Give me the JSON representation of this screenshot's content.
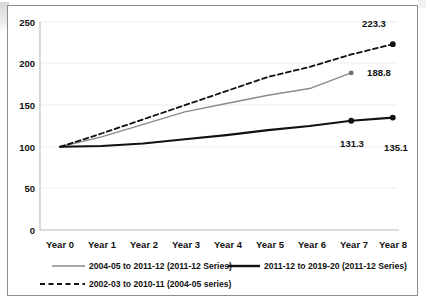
{
  "chart_data": {
    "type": "line",
    "title": "",
    "subtitle": "",
    "xlabel": "",
    "ylabel": "",
    "categories": [
      "Year 0",
      "Year 1",
      "Year 2",
      "Year 3",
      "Year 4",
      "Year 5",
      "Year 6",
      "Year 7",
      "Year 8"
    ],
    "ylim": [
      0,
      250
    ],
    "yticks": [
      0,
      50,
      100,
      150,
      200,
      250
    ],
    "ytick_labels": [
      "0",
      "50",
      "100",
      "150",
      "200",
      "250"
    ],
    "grid": true,
    "legend_position": "bottom",
    "series": [
      {
        "name": "2004-05 to 2011-12 (2011-12 Series)",
        "style": "solid",
        "color": "#8a8a8a",
        "width": 1.4,
        "values": [
          100,
          112,
          127,
          142,
          152,
          162,
          170,
          188.8,
          null
        ],
        "end_marker": true,
        "labels": [
          null,
          null,
          null,
          null,
          null,
          null,
          null,
          "188.8",
          null
        ]
      },
      {
        "name": "2011-12 to 2019-20 (2011-12 Series)",
        "style": "solid",
        "color": "#111111",
        "width": 2.1,
        "values": [
          100,
          101,
          104,
          109,
          114,
          120,
          125,
          131.3,
          135.1
        ],
        "end_marker": true,
        "labels": [
          null,
          null,
          null,
          null,
          null,
          null,
          null,
          "131.3",
          "135.1"
        ]
      },
      {
        "name": "2002-03 to 2010-11 (2004-05 series)",
        "style": "dashed",
        "color": "#111111",
        "width": 1.8,
        "values": [
          100,
          116,
          133,
          150,
          167,
          184,
          196,
          211,
          223.3
        ],
        "end_marker": true,
        "labels": [
          null,
          null,
          null,
          null,
          null,
          null,
          null,
          null,
          "223.3"
        ]
      }
    ],
    "annotations": [
      {
        "text": "223.3",
        "series": "2002-03 to 2010-11 (2004-05 series)",
        "x": "Year 8",
        "y": 223.3
      },
      {
        "text": "188.8",
        "series": "2004-05 to 2011-12 (2011-12 Series)",
        "x": "Year 7",
        "y": 188.8
      },
      {
        "text": "131.3",
        "series": "2011-12 to 2019-20 (2011-12 Series)",
        "x": "Year 7",
        "y": 131.3
      },
      {
        "text": "135.1",
        "series": "2011-12 to 2019-20 (2011-12 Series)",
        "x": "Year 8",
        "y": 135.1
      }
    ]
  },
  "legend": {
    "items": [
      {
        "label": "2004-05 to 2011-12 (2011-12 Series)",
        "style": "solid",
        "color": "#8a8a8a"
      },
      {
        "label": "2011-12 to 2019-20 (2011-12 Series)",
        "style": "solid",
        "color": "#111111"
      },
      {
        "label": "2002-03 to 2010-11 (2004-05 series)",
        "style": "dashed",
        "color": "#111111"
      }
    ]
  },
  "axis": {
    "y_ticks": [
      "250",
      "200",
      "150",
      "100",
      "50",
      "0"
    ],
    "x_ticks": [
      "Year 0",
      "Year 1",
      "Year 2",
      "Year 3",
      "Year 4",
      "Year 5",
      "Year 6",
      "Year 7",
      "Year 8"
    ]
  },
  "colors": {
    "series_gray": "#8a8a8a",
    "series_black": "#111111",
    "frame": "#8d8d8d",
    "grid": "#e9e9e9",
    "axis": "#b9b9b9"
  }
}
